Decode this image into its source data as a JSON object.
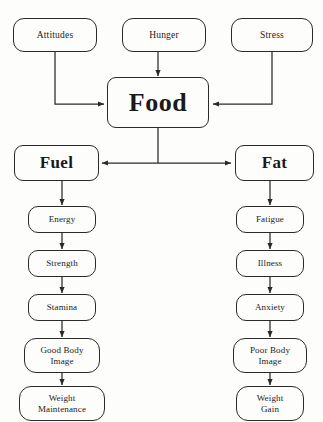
{
  "diagram": {
    "background_color": "#fdfdfb",
    "line_color": "#2a2a2a",
    "nodes": {
      "attitudes": {
        "label": "Attitudes"
      },
      "hunger": {
        "label": "Hunger"
      },
      "stress": {
        "label": "Stress"
      },
      "food": {
        "label": "Food"
      },
      "fuel": {
        "label": "Fuel"
      },
      "fat": {
        "label": "Fat"
      },
      "energy": {
        "label": "Energy"
      },
      "strength": {
        "label": "Strength"
      },
      "stamina": {
        "label": "Stamina"
      },
      "good_body_image": {
        "label": "Good Body\nImage",
        "line1": "Good Body",
        "line2": "Image"
      },
      "weight_maintenance": {
        "label": "Weight\nMaintenance",
        "line1": "Weight",
        "line2": "Maintenance"
      },
      "fatigue": {
        "label": "Fatigue"
      },
      "illness": {
        "label": "Illness"
      },
      "anxiety": {
        "label": "Anxiety"
      },
      "poor_body_image": {
        "label": "Poor Body\nImage",
        "line1": "Poor Body",
        "line2": "Image"
      },
      "weight_gain": {
        "label": "Weight\nGain",
        "line1": "Weight",
        "line2": "Gain"
      }
    },
    "edges": [
      {
        "from": "attitudes",
        "to": "food",
        "style": "elbow-down-right"
      },
      {
        "from": "hunger",
        "to": "food",
        "style": "straight-down"
      },
      {
        "from": "stress",
        "to": "food",
        "style": "elbow-down-left"
      },
      {
        "from": "food",
        "to": "fuel",
        "style": "tee-left"
      },
      {
        "from": "food",
        "to": "fat",
        "style": "tee-right"
      },
      {
        "from": "fuel",
        "to": "energy",
        "style": "straight-down"
      },
      {
        "from": "energy",
        "to": "strength",
        "style": "straight-down"
      },
      {
        "from": "strength",
        "to": "stamina",
        "style": "straight-down"
      },
      {
        "from": "stamina",
        "to": "good_body_image",
        "style": "straight-down"
      },
      {
        "from": "good_body_image",
        "to": "weight_maintenance",
        "style": "straight-down"
      },
      {
        "from": "fat",
        "to": "fatigue",
        "style": "straight-down"
      },
      {
        "from": "fatigue",
        "to": "illness",
        "style": "straight-down"
      },
      {
        "from": "illness",
        "to": "anxiety",
        "style": "straight-down"
      },
      {
        "from": "anxiety",
        "to": "poor_body_image",
        "style": "straight-down"
      },
      {
        "from": "poor_body_image",
        "to": "weight_gain",
        "style": "straight-down"
      }
    ]
  }
}
